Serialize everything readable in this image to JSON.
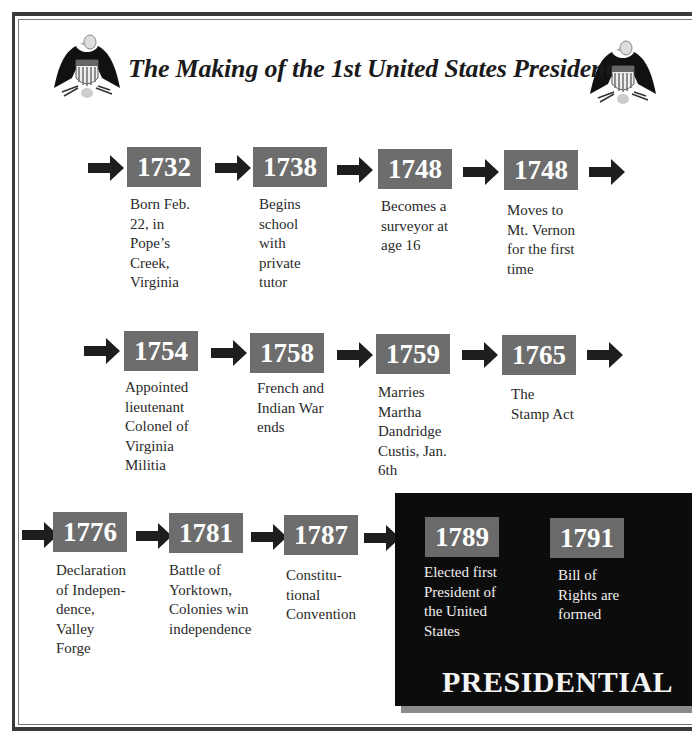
{
  "header": {
    "title": "The Making of the 1st United States President",
    "left_icon": "eagle-shield-icon",
    "right_icon": "eagle-shield-icon"
  },
  "colors": {
    "year_box": "#6d6d6d",
    "year_text": "#ffffff",
    "arrow": "#1e1e1e",
    "presidential_panel": "#0c0c0c",
    "panel_shadow": "#8a8a8a"
  },
  "timeline": {
    "row1": [
      {
        "year": "1732",
        "text": "Born Feb.\n22, in\nPope’s\nCreek,\nVirginia"
      },
      {
        "year": "1738",
        "text": "Begins\nschool\nwith\nprivate\ntutor"
      },
      {
        "year": "1748",
        "text": "Becomes a\nsurveyor at\nage 16"
      },
      {
        "year": "1748",
        "text": "Moves to\nMt. Vernon\nfor the first\ntime"
      }
    ],
    "row2": [
      {
        "year": "1754",
        "text": "Appointed\nlieutenant\nColonel of\nVirginia\nMilitia"
      },
      {
        "year": "1758",
        "text": "French and\nIndian War\nends"
      },
      {
        "year": "1759",
        "text": "Marries\nMartha\nDandridge\nCustis, Jan.\n6th"
      },
      {
        "year": "1765",
        "text": "The\nStamp Act"
      }
    ],
    "row3": [
      {
        "year": "1776",
        "text": "Declaration\nof Indepen-\ndence,\nValley\nForge"
      },
      {
        "year": "1781",
        "text": "Battle of\nYorktown,\nColonies win\nindependence"
      },
      {
        "year": "1787",
        "text": "Constitu-\ntional\nConvention"
      }
    ],
    "presidential": {
      "label": "PRESIDENTIAL",
      "items": [
        {
          "year": "1789",
          "text": "Elected first\nPresident of\nthe United\nStates"
        },
        {
          "year": "1791",
          "text": "Bill of\nRights are\nformed"
        }
      ]
    }
  }
}
